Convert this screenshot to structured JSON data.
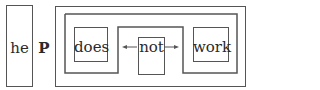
{
  "diagram": {
    "left_box": {
      "label": "he"
    },
    "connector": {
      "label": "P"
    },
    "inner_boxes": [
      {
        "label": "does"
      },
      {
        "label": "not"
      },
      {
        "label": "work"
      }
    ],
    "arrows": [
      {
        "from": "not",
        "to": "does",
        "direction": "left",
        "glyph": "←"
      },
      {
        "from": "not",
        "to": "work",
        "direction": "right",
        "glyph": "→"
      }
    ],
    "colors": {
      "stroke": "#555555",
      "text": "#2a2a2a",
      "background": "#ffffff"
    }
  }
}
